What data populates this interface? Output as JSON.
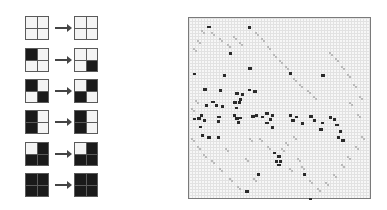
{
  "figure": {
    "rule_table": {
      "description": "Block cellular automaton rules (2x2 neighborhood, cells listed TL, TR, BL, BR; 1 = black)",
      "rules": [
        {
          "input": [
            0,
            0,
            0,
            0
          ],
          "output": [
            0,
            0,
            0,
            0
          ]
        },
        {
          "input": [
            1,
            0,
            0,
            0
          ],
          "output": [
            0,
            0,
            0,
            1
          ]
        },
        {
          "input": [
            1,
            0,
            0,
            1
          ],
          "output": [
            0,
            1,
            1,
            0
          ]
        },
        {
          "input": [
            1,
            0,
            1,
            0
          ],
          "output": [
            1,
            0,
            1,
            0
          ]
        },
        {
          "input": [
            0,
            1,
            1,
            1
          ],
          "output": [
            0,
            1,
            1,
            1
          ]
        },
        {
          "input": [
            1,
            1,
            1,
            1
          ],
          "output": [
            1,
            1,
            1,
            1
          ]
        }
      ],
      "arrow_icon": "right-arrow"
    },
    "simulation": {
      "description": "Fine-grid lattice gas simulation snapshot with dark particles and light diagonal traces",
      "colors": {
        "particle": "#2a2a2a",
        "trace": "#b9b9b9",
        "grid": "#e2e2e2",
        "background": "#f7f7f7",
        "border": "#7a7a7a"
      },
      "particles": [
        [
          18,
          8
        ],
        [
          59,
          8
        ],
        [
          40,
          34
        ],
        [
          59,
          49
        ],
        [
          4,
          55
        ],
        [
          34,
          56
        ],
        [
          14,
          70
        ],
        [
          30,
          71
        ],
        [
          59,
          71
        ],
        [
          64,
          72
        ],
        [
          49,
          83
        ],
        [
          16,
          86
        ],
        [
          22,
          83
        ],
        [
          26,
          86
        ],
        [
          32,
          87
        ],
        [
          44,
          83
        ],
        [
          46,
          89
        ],
        [
          50,
          80
        ],
        [
          46,
          74
        ],
        [
          52,
          75
        ],
        [
          4,
          100
        ],
        [
          8,
          99
        ],
        [
          11,
          96
        ],
        [
          14,
          101
        ],
        [
          28,
          98
        ],
        [
          28,
          102
        ],
        [
          44,
          96
        ],
        [
          46,
          99
        ],
        [
          50,
          99
        ],
        [
          48,
          103
        ],
        [
          62,
          97
        ],
        [
          66,
          96
        ],
        [
          72,
          98
        ],
        [
          76,
          94
        ],
        [
          80,
          100
        ],
        [
          82,
          96
        ],
        [
          76,
          104
        ],
        [
          82,
          108
        ],
        [
          100,
          96
        ],
        [
          102,
          101
        ],
        [
          106,
          98
        ],
        [
          112,
          104
        ],
        [
          120,
          97
        ],
        [
          124,
          101
        ],
        [
          132,
          104
        ],
        [
          130,
          110
        ],
        [
          140,
          98
        ],
        [
          144,
          100
        ],
        [
          146,
          106
        ],
        [
          150,
          112
        ],
        [
          148,
          118
        ],
        [
          152,
          121
        ],
        [
          10,
          108
        ],
        [
          12,
          116
        ],
        [
          18,
          118
        ],
        [
          28,
          118
        ],
        [
          84,
          134
        ],
        [
          88,
          137
        ],
        [
          86,
          142
        ],
        [
          90,
          142
        ],
        [
          88,
          146
        ],
        [
          68,
          155
        ],
        [
          114,
          155
        ],
        [
          56,
          172
        ],
        [
          120,
          180
        ],
        [
          100,
          54
        ],
        [
          132,
          56
        ]
      ],
      "traces": [
        [
          12,
          12
        ],
        [
          22,
          14
        ],
        [
          30,
          20
        ],
        [
          38,
          26
        ],
        [
          8,
          22
        ],
        [
          4,
          30
        ],
        [
          44,
          18
        ],
        [
          50,
          24
        ],
        [
          66,
          14
        ],
        [
          72,
          20
        ],
        [
          78,
          28
        ],
        [
          84,
          36
        ],
        [
          90,
          42
        ],
        [
          96,
          48
        ],
        [
          104,
          60
        ],
        [
          110,
          66
        ],
        [
          118,
          72
        ],
        [
          124,
          78
        ],
        [
          140,
          34
        ],
        [
          146,
          40
        ],
        [
          152,
          48
        ],
        [
          158,
          56
        ],
        [
          164,
          66
        ],
        [
          170,
          78
        ],
        [
          2,
          90
        ],
        [
          6,
          82
        ],
        [
          2,
          120
        ],
        [
          8,
          128
        ],
        [
          14,
          136
        ],
        [
          22,
          142
        ],
        [
          30,
          150
        ],
        [
          40,
          160
        ],
        [
          48,
          168
        ],
        [
          70,
          120
        ],
        [
          78,
          128
        ],
        [
          92,
          130
        ],
        [
          96,
          124
        ],
        [
          104,
          118
        ],
        [
          112,
          148
        ],
        [
          120,
          162
        ],
        [
          128,
          170
        ],
        [
          136,
          164
        ],
        [
          144,
          156
        ],
        [
          152,
          146
        ],
        [
          158,
          138
        ],
        [
          166,
          128
        ],
        [
          172,
          118
        ],
        [
          36,
          130
        ],
        [
          60,
          120
        ],
        [
          108,
          140
        ],
        [
          100,
          150
        ],
        [
          64,
          160
        ],
        [
          56,
          140
        ],
        [
          168,
          96
        ],
        [
          160,
          84
        ]
      ]
    }
  }
}
